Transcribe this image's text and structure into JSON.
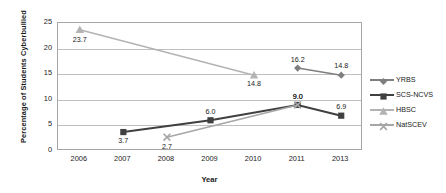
{
  "chart_data": {
    "type": "line",
    "title": "",
    "xlabel": "Year",
    "ylabel": "Percentage of Students Cyberbullied",
    "categories": [
      "2006",
      "2007",
      "2008",
      "2009",
      "2010",
      "2011",
      "2013"
    ],
    "ylim": [
      0,
      25
    ],
    "yticks": [
      0,
      5,
      10,
      15,
      20,
      25
    ],
    "ytick_labels": [
      "0",
      "5",
      "10",
      "15",
      "20",
      "25"
    ],
    "grid": "horizontal",
    "legend_position": "right",
    "series": [
      {
        "name": "YRBS",
        "color": "#7f7f7f",
        "marker": "diamond",
        "points": [
          {
            "x": "2011",
            "y": 16.2,
            "label": "16.2"
          },
          {
            "x": "2013",
            "y": 14.8,
            "label": "14.8"
          }
        ]
      },
      {
        "name": "SCS-NCVS",
        "color": "#404040",
        "marker": "square",
        "points": [
          {
            "x": "2007",
            "y": 3.7,
            "label": "3.7"
          },
          {
            "x": "2009",
            "y": 6.0,
            "label": "6.0"
          },
          {
            "x": "2011",
            "y": 9.0,
            "label": "9.0"
          },
          {
            "x": "2013",
            "y": 6.9,
            "label": "6.9"
          }
        ]
      },
      {
        "name": "HBSC",
        "color": "#b3b3b3",
        "marker": "triangle",
        "points": [
          {
            "x": "2006",
            "y": 23.7,
            "label": "23.7"
          },
          {
            "x": "2010",
            "y": 14.8,
            "label": "14.8"
          }
        ]
      },
      {
        "name": "NatSCEV",
        "color": "#a6a6a6",
        "marker": "x",
        "points": [
          {
            "x": "2008",
            "y": 2.7,
            "label": "2.7"
          },
          {
            "x": "2011",
            "y": 9.0,
            "label": "9.0"
          }
        ]
      }
    ]
  },
  "axis": {
    "ylabel": "Percentage of Students Cyberbullied",
    "xlabel": "Year"
  },
  "legend": {
    "items": [
      {
        "label": "YRBS"
      },
      {
        "label": "SCS-NCVS"
      },
      {
        "label": "HBSC"
      },
      {
        "label": "NatSCEV"
      }
    ]
  }
}
